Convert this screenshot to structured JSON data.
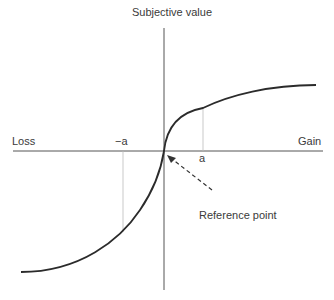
{
  "diagram": {
    "title": "Subjective value",
    "x_axis": {
      "left_label": "Loss",
      "right_label": "Gain"
    },
    "ticks": {
      "negative": "−a",
      "positive": "a"
    },
    "annotation": {
      "label": "Reference point"
    },
    "colors": {
      "curve": "#2b2b2b",
      "axis": "#555555",
      "guide": "#bbbbbb",
      "text": "#3a3a3a"
    }
  }
}
